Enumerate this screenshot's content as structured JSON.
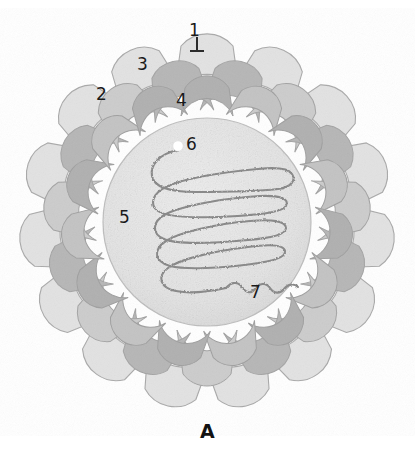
{
  "figure": {
    "panel_label": "A",
    "background_color": "#ffffff"
  },
  "palette": {
    "outer_spike_light": "#e3e3e3",
    "outer_spike_mid": "#cfcfcf",
    "shell_dark": "#b4b4b4",
    "shell_mid": "#c6c6c6",
    "inner_core_light": "#e7e7e7",
    "core_speckle": "#d0d0d0",
    "genome_strand": "#8c8c8c",
    "outline": "#9a9a9a",
    "label_text": "#1a1a1a",
    "end_marker": "#ffffff"
  },
  "labels": [
    {
      "id": "1",
      "text": "1",
      "x": 189,
      "y": 22,
      "target": "outer-spike-vp4",
      "leader": true
    },
    {
      "id": "2",
      "text": "2",
      "x": 96,
      "y": 86,
      "target": "outer-capsid-vp7",
      "leader": false
    },
    {
      "id": "3",
      "text": "3",
      "x": 137,
      "y": 56,
      "target": "capsid-trimer",
      "leader": false
    },
    {
      "id": "4",
      "text": "4",
      "x": 176,
      "y": 92,
      "target": "middle-layer-vp6",
      "leader": false
    },
    {
      "id": "5",
      "text": "5",
      "x": 119,
      "y": 209,
      "target": "inner-core-vp2",
      "leader": false
    },
    {
      "id": "6",
      "text": "6",
      "x": 186,
      "y": 136,
      "target": "genome-end-marker",
      "leader": false
    },
    {
      "id": "7",
      "text": "7",
      "x": 250,
      "y": 284,
      "target": "dsrna-genome-segment",
      "leader": false
    }
  ],
  "structure": {
    "spike_count": 15,
    "center_x": 207,
    "center_y": 222,
    "core_radius": 104,
    "shell_inner_radius": 108,
    "shell_outer_radius": 152,
    "spike_outer_radius": 186,
    "genome": {
      "type": "serpentine-fold",
      "passes": 5,
      "end_marker": {
        "x": 178,
        "y": 146,
        "r": 5,
        "color": "#ffffff"
      }
    }
  }
}
